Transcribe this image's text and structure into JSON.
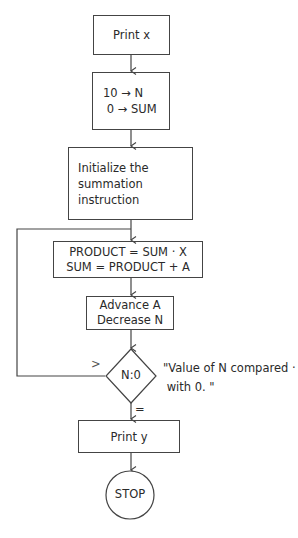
{
  "flowchart": {
    "nodes": [
      {
        "id": "print-x",
        "type": "process",
        "lines": [
          "Print x"
        ]
      },
      {
        "id": "init-counters",
        "type": "process",
        "lines": [
          "10 → N",
          " 0 → SUM"
        ]
      },
      {
        "id": "init-summation",
        "type": "process",
        "lines": [
          "Initialize the",
          "summation",
          "instruction"
        ]
      },
      {
        "id": "compute",
        "type": "process",
        "lines": [
          "PRODUCT = SUM · X",
          "SUM = PRODUCT + A"
        ]
      },
      {
        "id": "advance",
        "type": "process",
        "lines": [
          "Advance A",
          "Decrease N"
        ]
      },
      {
        "id": "compare",
        "type": "decision",
        "label": "N:0"
      },
      {
        "id": "print-y",
        "type": "process",
        "lines": [
          "Print y"
        ]
      },
      {
        "id": "stop",
        "type": "terminal",
        "label": "STOP"
      }
    ],
    "edges": [
      {
        "from": "print-x",
        "to": "init-counters"
      },
      {
        "from": "init-counters",
        "to": "init-summation"
      },
      {
        "from": "init-summation",
        "to": "compute"
      },
      {
        "from": "compute",
        "to": "advance"
      },
      {
        "from": "advance",
        "to": "compare"
      },
      {
        "from": "compare",
        "to": "compute",
        "label": ">"
      },
      {
        "from": "compare",
        "to": "print-y",
        "label": "="
      },
      {
        "from": "print-y",
        "to": "stop"
      }
    ],
    "annotation": [
      "\"Value of N compared ·",
      " with 0. \""
    ],
    "branch_labels": {
      "greater": ">",
      "equal": "="
    }
  }
}
